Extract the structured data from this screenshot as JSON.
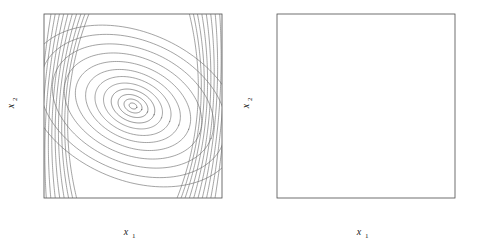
{
  "figure": {
    "background_color": "#ffffff",
    "axis_color": "#4d4d4d",
    "line_color": "#6b6b6b"
  },
  "chart_data": [
    {
      "type": "line",
      "panel": "left",
      "title": "",
      "subtitle": "",
      "xlabel": "x_1",
      "ylabel": "x_2",
      "xlabel_display": "x",
      "xlabel_subscript": "1",
      "ylabel_display": "x",
      "ylabel_subscript": "2",
      "xlim": [
        -10,
        10
      ],
      "ylim": [
        -10,
        10
      ],
      "xticks": [
        -10,
        -5,
        0,
        5,
        10
      ],
      "yticks": [
        -10,
        -5,
        0,
        5,
        10
      ],
      "xticklabels": [
        "-10",
        "-5",
        "0",
        "5",
        "10"
      ],
      "yticklabels": [
        "-10",
        "-5",
        "0",
        "5",
        "10"
      ],
      "grid": false,
      "legend": null,
      "description": "Phase portrait of a center: nested closed elliptical orbits around the origin, tilted with major axis along the line from lower-left to upper-right, plus near-vertical open trajectories near the left and right edges",
      "equilibrium": {
        "x": 0,
        "y": 0,
        "kind": "center"
      },
      "orbit_tilt_deg": -22,
      "closed_orbit_semi_axes": [
        {
          "a": 0.45,
          "b": 0.3
        },
        {
          "a": 1.05,
          "b": 0.7
        },
        {
          "a": 1.75,
          "b": 1.15
        },
        {
          "a": 2.55,
          "b": 1.7
        },
        {
          "a": 3.45,
          "b": 2.3
        },
        {
          "a": 4.45,
          "b": 2.95
        },
        {
          "a": 5.55,
          "b": 3.65
        },
        {
          "a": 6.75,
          "b": 4.45
        },
        {
          "a": 8.05,
          "b": 5.3
        },
        {
          "a": 9.45,
          "b": 6.2
        },
        {
          "a": 10.9,
          "b": 7.15
        },
        {
          "a": 12.4,
          "b": 8.05
        }
      ],
      "open_curve_x_offsets": [
        -9.6,
        -9.0,
        -8.4,
        -7.8,
        -7.2,
        -6.6,
        -6.0,
        -5.4,
        -4.85,
        -4.3,
        4.3,
        4.85,
        5.4,
        6.0,
        6.6,
        7.2,
        7.8,
        8.4,
        9.0,
        9.6
      ]
    },
    {
      "type": "line",
      "panel": "right",
      "title": "",
      "subtitle": "",
      "xlabel": "x_1",
      "ylabel": "x_2",
      "xlabel_display": "x",
      "xlabel_subscript": "1",
      "ylabel_display": "x",
      "ylabel_subscript": "2",
      "xlim": [
        -10,
        10
      ],
      "ylim": [
        -10,
        10
      ],
      "xticks": [
        -10,
        -5,
        0,
        5,
        10
      ],
      "yticks": [
        -10,
        -5,
        0,
        5,
        10
      ],
      "xticklabels": [
        "-10",
        "-5",
        "0",
        "5",
        "10"
      ],
      "yticklabels": [
        "-10",
        "-5",
        "0",
        "5",
        "10"
      ],
      "grid": false,
      "legend": null,
      "description": "Phase portrait of a stable focus: a small number of trajectories spiral inward clockwise toward the origin, with tilted elliptical loops; short near-vertical trajectory segments appear near the left and right edges",
      "equilibrium": {
        "x": 0,
        "y": 0,
        "kind": "stable-focus"
      },
      "orbit_tilt_deg": -22,
      "spiral_decay_per_turn": 0.42,
      "spirals": [
        {
          "start_radius": 12.0,
          "start_angle_deg": 58,
          "turns": 2.55
        },
        {
          "start_radius": 10.4,
          "start_angle_deg": 110,
          "turns": 2.45
        },
        {
          "start_radius": 9.4,
          "start_angle_deg": 140,
          "turns": 2.35
        },
        {
          "start_radius": 12.6,
          "start_angle_deg": 250,
          "turns": 2.3
        },
        {
          "start_radius": 11.2,
          "start_angle_deg": 292,
          "turns": 2.2
        }
      ],
      "edge_segment_x_offsets": [
        -7.8,
        -7.5,
        4.6,
        5.6,
        7.9
      ]
    }
  ]
}
